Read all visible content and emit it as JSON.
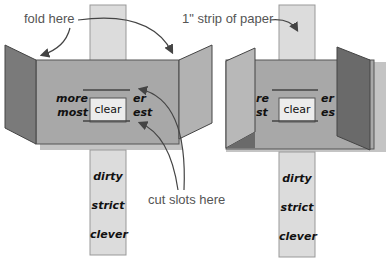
{
  "labels": {
    "fold_here": "fold here",
    "strip_of_paper": "1\" strip of paper",
    "cut_slots_here": "cut slots here"
  },
  "left_model": {
    "prefixes": [
      "more",
      "most"
    ],
    "window_word": "clear",
    "suffixes": [
      "er",
      "est"
    ],
    "strip_words": [
      "dirty",
      "strict",
      "clever"
    ]
  },
  "right_model": {
    "prefixes": [
      "re",
      "st"
    ],
    "window_word": "clear",
    "suffixes": [
      "er",
      "es"
    ],
    "strip_words": [
      "dirty",
      "strict",
      "clever"
    ]
  },
  "colors": {
    "strip": "#dcdcdc",
    "panel": "#a8a8a8",
    "flap_dark": "#707070",
    "flap_light": "#b8b8b8",
    "shadow": "#c4c4c4",
    "text": "#111111",
    "label": "#555555"
  }
}
